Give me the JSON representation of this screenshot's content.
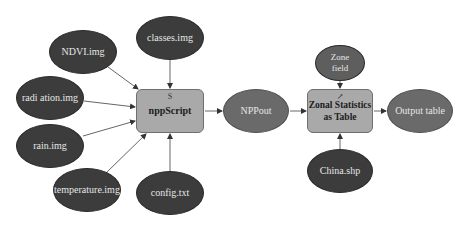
{
  "diagram": {
    "type": "model-builder-flowchart",
    "inputs": [
      {
        "id": "ndvi",
        "label": "NDVI.img"
      },
      {
        "id": "classes",
        "label": "classes.img"
      },
      {
        "id": "radiation",
        "label": "radi ation.img"
      },
      {
        "id": "rain",
        "label": "rain.img"
      },
      {
        "id": "temperature",
        "label": "temperature.img"
      },
      {
        "id": "config",
        "label": "config.txt"
      }
    ],
    "tools": [
      {
        "id": "nppscript",
        "label": "nppScript",
        "glyph": "S"
      },
      {
        "id": "zonal",
        "label": "Zonal Statistics\nas Table",
        "glyph": "↗"
      }
    ],
    "intermediate": [
      {
        "id": "nppout",
        "label": "NPPout"
      }
    ],
    "params": [
      {
        "id": "zonefield",
        "label": "Zone\nfield"
      },
      {
        "id": "china",
        "label": "China.shp"
      }
    ],
    "outputs": [
      {
        "id": "outputtable",
        "label": "Output table"
      }
    ],
    "edges": [
      {
        "from": "NDVI.img",
        "to": "nppScript"
      },
      {
        "from": "classes.img",
        "to": "nppScript"
      },
      {
        "from": "radi ation.img",
        "to": "nppScript"
      },
      {
        "from": "rain.img",
        "to": "nppScript"
      },
      {
        "from": "temperature.img",
        "to": "nppScript"
      },
      {
        "from": "config.txt",
        "to": "nppScript"
      },
      {
        "from": "nppScript",
        "to": "NPPout"
      },
      {
        "from": "NPPout",
        "to": "Zonal Statistics as Table"
      },
      {
        "from": "Zone field",
        "to": "Zonal Statistics as Table"
      },
      {
        "from": "China.shp",
        "to": "Zonal Statistics as Table"
      },
      {
        "from": "Zonal Statistics as Table",
        "to": "Output table"
      }
    ],
    "colors": {
      "input_fill": "#3c3c3c",
      "intermediate_fill": "#6a6a6a",
      "tool_fill": "#a9a9a9",
      "edge": "#555555",
      "background": "#ffffff"
    }
  }
}
